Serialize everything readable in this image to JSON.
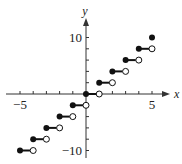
{
  "chart_data": {
    "type": "line",
    "title": "",
    "xlabel": "x",
    "ylabel": "y",
    "xlim": [
      -5.8,
      6.2
    ],
    "ylim": [
      -11,
      13
    ],
    "grid": false,
    "legend": null,
    "x_ticks": [
      -5,
      -4,
      -3,
      -2,
      -1,
      0,
      1,
      2,
      3,
      4,
      5
    ],
    "y_ticks": [
      -10,
      -8,
      -6,
      -4,
      -2,
      0,
      2,
      4,
      6,
      8,
      10
    ],
    "x_tick_labels": [
      {
        "value": -5,
        "label": "−5"
      },
      {
        "value": 5,
        "label": "5"
      }
    ],
    "y_tick_labels": [
      {
        "value": 10,
        "label": "10"
      },
      {
        "value": -10,
        "label": "−10"
      }
    ],
    "function": "y = 2⌊x⌋",
    "segments": [
      {
        "x_start": -5,
        "x_end": -4,
        "y": -10,
        "start_closed": true,
        "end_open": true
      },
      {
        "x_start": -4,
        "x_end": -3,
        "y": -8,
        "start_closed": true,
        "end_open": true
      },
      {
        "x_start": -3,
        "x_end": -2,
        "y": -6,
        "start_closed": true,
        "end_open": true
      },
      {
        "x_start": -2,
        "x_end": -1,
        "y": -4,
        "start_closed": true,
        "end_open": true
      },
      {
        "x_start": -1,
        "x_end": 0,
        "y": -2,
        "start_closed": true,
        "end_open": true
      },
      {
        "x_start": 0,
        "x_end": 1,
        "y": 0,
        "start_closed": true,
        "end_open": true
      },
      {
        "x_start": 1,
        "x_end": 2,
        "y": 2,
        "start_closed": true,
        "end_open": true
      },
      {
        "x_start": 2,
        "x_end": 3,
        "y": 4,
        "start_closed": true,
        "end_open": true
      },
      {
        "x_start": 3,
        "x_end": 4,
        "y": 6,
        "start_closed": true,
        "end_open": true
      },
      {
        "x_start": 4,
        "x_end": 5,
        "y": 8,
        "start_closed": true,
        "end_open": true
      }
    ],
    "isolated_points": [
      {
        "x": 5,
        "y": 10,
        "closed": true
      }
    ]
  },
  "layout": {
    "origin_px": [
      86,
      94
    ],
    "px_per_x": 13.2,
    "px_per_y": 5.65
  }
}
